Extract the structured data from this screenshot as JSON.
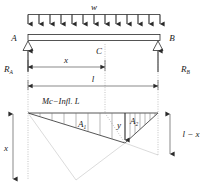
{
  "figure": {
    "width": 210,
    "height": 185
  },
  "load": {
    "label": "w",
    "arrow_count": 13,
    "description": "uniformly-distributed-load"
  },
  "beam": {
    "left_support_label": "A",
    "right_support_label": "B",
    "section_label": "C"
  },
  "reactions": {
    "left": "R",
    "left_sub": "A",
    "right": "R",
    "right_sub": "B"
  },
  "dimensions": {
    "x_label": "x",
    "l_label": "l",
    "left_vertical_label": "x",
    "right_vertical_label": "l − x"
  },
  "influence_line": {
    "caption": "Mc−Infl. L",
    "ordinate_label": "y",
    "area_left": "A",
    "area_left_sub": "1",
    "area_right": "A",
    "area_right_sub": "2",
    "hatch_left_count": 7,
    "hatch_right_count": 6
  },
  "colors": {
    "ink": "#2b2b2b",
    "thin": "#3a3a3a",
    "hatch": "#6e6e6e",
    "faint": "#c2c2c2",
    "dotted": "#9a9a9a",
    "background": "#ffffff"
  }
}
